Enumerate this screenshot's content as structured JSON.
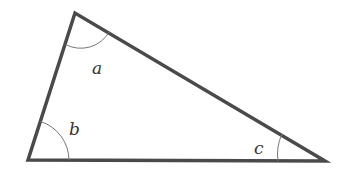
{
  "diagram": {
    "type": "triangle",
    "angles": [
      {
        "label": "a",
        "vertex": "top"
      },
      {
        "label": "b",
        "vertex": "bottom-left"
      },
      {
        "label": "c",
        "vertex": "bottom-right"
      }
    ],
    "colors": {
      "stroke": "#4a4a4a",
      "arc": "#666666",
      "label": "#333333"
    }
  }
}
